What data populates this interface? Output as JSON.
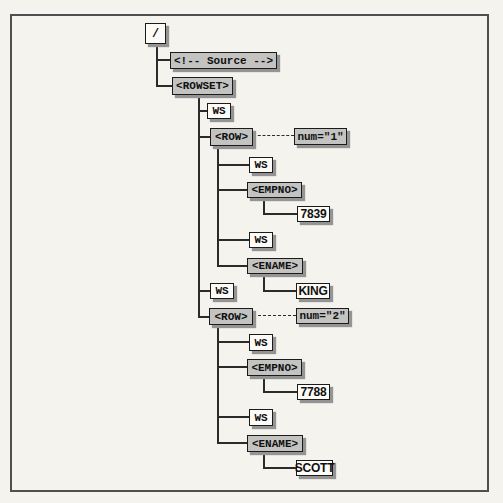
{
  "figure": {
    "colors": {
      "background": "#f4f3ee",
      "frame_border": "#4f4f4f",
      "element_box_fill": "#c3c3c2",
      "value_box_fill": "#fcfbf7",
      "box_border": "#1b1b1b",
      "box_shadow": "#949494",
      "connector_line": "#2b2b2b"
    },
    "nodes": [
      {
        "label": "/",
        "kind": "document-root"
      },
      {
        "label": "<!-- Source -->",
        "kind": "comment"
      },
      {
        "label": "<ROWSET>",
        "kind": "element"
      },
      {
        "label": "WS",
        "kind": "whitespace-text"
      },
      {
        "label": "<ROW>",
        "kind": "element"
      },
      {
        "label": "num=\"1\"",
        "kind": "attribute"
      },
      {
        "label": "WS",
        "kind": "whitespace-text"
      },
      {
        "label": "<EMPNO>",
        "kind": "element"
      },
      {
        "label": "7839",
        "kind": "text-value"
      },
      {
        "label": "WS",
        "kind": "whitespace-text"
      },
      {
        "label": "<ENAME>",
        "kind": "element"
      },
      {
        "label": "KING",
        "kind": "text-value"
      },
      {
        "label": "WS",
        "kind": "whitespace-text"
      },
      {
        "label": "<ROW>",
        "kind": "element"
      },
      {
        "label": "num=\"2\"",
        "kind": "attribute"
      },
      {
        "label": "WS",
        "kind": "whitespace-text"
      },
      {
        "label": "<EMPNO>",
        "kind": "element"
      },
      {
        "label": "7788",
        "kind": "text-value"
      },
      {
        "label": "WS",
        "kind": "whitespace-text"
      },
      {
        "label": "<ENAME>",
        "kind": "element"
      },
      {
        "label": "SCOTT",
        "kind": "text-value"
      }
    ]
  }
}
